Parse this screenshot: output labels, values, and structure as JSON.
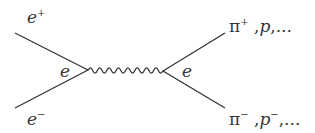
{
  "diagram": {
    "type": "feynman",
    "labels": {
      "incoming_top": {
        "base": "e",
        "sup": "+"
      },
      "incoming_bottom": {
        "base": "e",
        "sup": "−"
      },
      "left_vertex": "e",
      "right_vertex": "e",
      "outgoing_top": {
        "pi": "π",
        "sup": "+",
        "rest_prefix": " ,",
        "p": "p",
        "rest": ",..."
      },
      "outgoing_bottom": {
        "pi": "π",
        "sup": "−",
        "rest_prefix": " ,",
        "p": "p",
        "p_sup": "−",
        "rest": ",..."
      }
    },
    "propagator": "wavy-photon",
    "line_color": "#333333"
  }
}
